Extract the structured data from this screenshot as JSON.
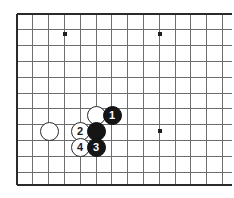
{
  "diagram": {
    "board": {
      "background_color": "#ffffff",
      "line_color": "#6e6e6e",
      "edge_line_color": "#2a2a2a",
      "star_point_color": "#1f1f1f",
      "origin_x": 17,
      "origin_y": 14,
      "spacing": 15.8,
      "columns": 14,
      "rows": 11,
      "left_edge_x": 17,
      "top_edge_y": 14,
      "bottom_edge_y": 185,
      "grid_right_x": 232,
      "star_points": [
        {
          "name": "star-point-top-left",
          "x": 65,
          "y": 34
        },
        {
          "name": "star-point-top-right",
          "x": 160,
          "y": 34
        },
        {
          "name": "star-point-bottom-left",
          "x": 49,
          "y": 131
        },
        {
          "name": "star-point-bottom-right",
          "x": 160,
          "y": 131
        }
      ]
    },
    "stones": [
      {
        "id": "stone-white-corner",
        "color": "white",
        "label": "",
        "x": 49,
        "y": 131,
        "diameter": 19
      },
      {
        "id": "stone-white-upper",
        "color": "white",
        "label": "",
        "x": 96,
        "y": 115,
        "diameter": 19
      },
      {
        "id": "stone-black-1",
        "color": "black",
        "label": "1",
        "x": 112,
        "y": 115,
        "diameter": 19
      },
      {
        "id": "stone-white-2",
        "color": "white",
        "label": "2",
        "x": 80,
        "y": 131,
        "diameter": 19
      },
      {
        "id": "stone-black-center",
        "color": "black",
        "label": "",
        "x": 96,
        "y": 131,
        "diameter": 19
      },
      {
        "id": "stone-white-4",
        "color": "white",
        "label": "4",
        "x": 80,
        "y": 147,
        "diameter": 19
      },
      {
        "id": "stone-black-3",
        "color": "black",
        "label": "3",
        "x": 96,
        "y": 147,
        "diameter": 19
      }
    ]
  }
}
